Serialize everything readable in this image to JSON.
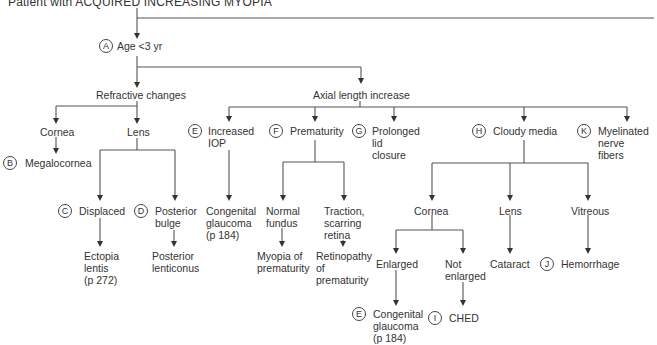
{
  "title": "Patient with ACQUIRED INCREASING MYOPIA",
  "nodes": {
    "age": {
      "badge": "A",
      "label": "Age <3 yr"
    },
    "refractive": {
      "label": "Refractive changes"
    },
    "axial": {
      "label": "Axial length increase"
    },
    "ref_cornea": {
      "label": "Cornea"
    },
    "ref_lens": {
      "label": "Lens"
    },
    "megalocornea": {
      "badge": "B",
      "label": "Megalocornea"
    },
    "displaced": {
      "badge": "C",
      "label": "Displaced"
    },
    "posterior_bulge": {
      "badge": "D",
      "label": "Posterior\nbulge"
    },
    "ectopia": {
      "label": "Ectopia\nlentis\n(p 272)"
    },
    "lenticonus": {
      "label": "Posterior\nlenticonus"
    },
    "increased_iop": {
      "badge": "E",
      "label": "Increased\nIOP"
    },
    "congenital_glaucoma_1": {
      "label": "Congenital\nglaucoma\n(p 184)"
    },
    "prematurity": {
      "badge": "F",
      "label": "Prematurity"
    },
    "normal_fundus": {
      "label": "Normal\nfundus"
    },
    "traction": {
      "label": "Traction,\nscarring\nretina"
    },
    "myopia_prematurity": {
      "label": "Myopia of\nprematurity"
    },
    "rop": {
      "label": "Retinopathy\nof\nprematurity"
    },
    "prolonged_lid": {
      "badge": "G",
      "label": "Prolonged\nlid\nclosure"
    },
    "cloudy_media": {
      "badge": "H",
      "label": "Cloudy media"
    },
    "cm_cornea": {
      "label": "Cornea"
    },
    "cm_lens": {
      "label": "Lens"
    },
    "cm_vitreous": {
      "label": "Vitreous"
    },
    "enlarged": {
      "label": "Enlarged"
    },
    "not_enlarged": {
      "label": "Not\nenlarged"
    },
    "congenital_glaucoma_2": {
      "badge": "E",
      "label": "Congenital\nglaucoma\n(p 184)"
    },
    "ched": {
      "badge": "I",
      "label": "CHED"
    },
    "cataract": {
      "label": "Cataract"
    },
    "hemorrhage": {
      "badge": "J",
      "label": "Hemorrhage"
    },
    "myelinated": {
      "badge": "K",
      "label": "Myelinated\nnerve\nfibers"
    }
  }
}
